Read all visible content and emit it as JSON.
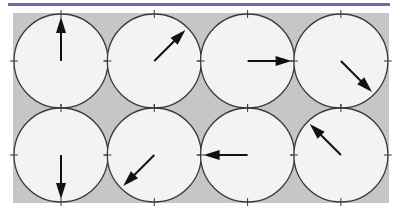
{
  "figure": {
    "colors": {
      "top_rule": "#6a6cb0",
      "panel": "#c6c6c6",
      "dial_face": "#f2f3f5",
      "dial_stroke": "#3a3a3a",
      "arrow": "#111111"
    },
    "dials": [
      {
        "row": 0,
        "col": 0,
        "arrow_angle_deg": 0,
        "direction": "up"
      },
      {
        "row": 0,
        "col": 1,
        "arrow_angle_deg": 45,
        "direction": "up-right"
      },
      {
        "row": 0,
        "col": 2,
        "arrow_angle_deg": 90,
        "direction": "right"
      },
      {
        "row": 0,
        "col": 3,
        "arrow_angle_deg": 135,
        "direction": "down-right"
      },
      {
        "row": 1,
        "col": 0,
        "arrow_angle_deg": 180,
        "direction": "down"
      },
      {
        "row": 1,
        "col": 1,
        "arrow_angle_deg": 225,
        "direction": "down-left"
      },
      {
        "row": 1,
        "col": 2,
        "arrow_angle_deg": 270,
        "direction": "left"
      },
      {
        "row": 1,
        "col": 3,
        "arrow_angle_deg": 315,
        "direction": "up-left"
      }
    ]
  }
}
